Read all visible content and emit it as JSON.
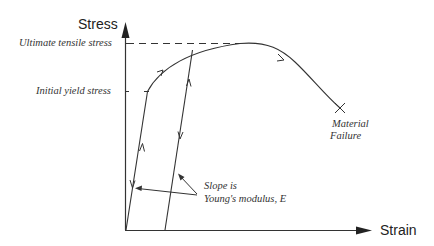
{
  "diagram": {
    "type": "stress-strain curve",
    "axes": {
      "y_label": "Stress",
      "x_label": "Strain"
    },
    "levels": {
      "ultimate": "Ultimate tensile stress",
      "yield": "Initial yield stress"
    },
    "annotations": {
      "slope_line1": "Slope is",
      "slope_line2": "Young's modulus, E",
      "failure_line1": "Material",
      "failure_line2": "Failure"
    },
    "colors": {
      "line": "#333333",
      "background": "#ffffff"
    }
  }
}
